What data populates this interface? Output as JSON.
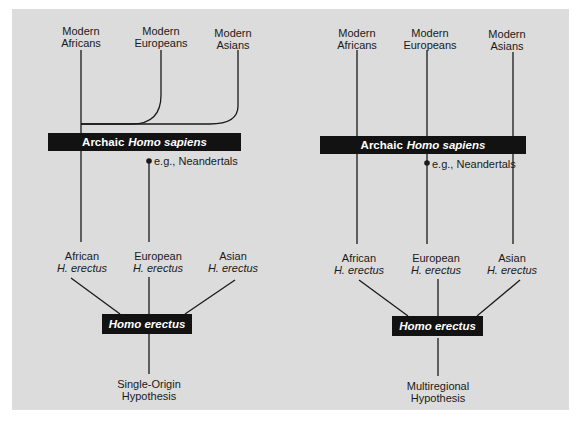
{
  "left": {
    "top_labels": [
      {
        "line1": "Modern",
        "line2": "Africans"
      },
      {
        "line1": "Modern",
        "line2": "Europeans"
      },
      {
        "line1": "Modern",
        "line2": "Asians"
      }
    ],
    "archaic_bar": {
      "plain": "Archaic",
      "italic": "Homo sapiens"
    },
    "note": "e.g., Neandertals",
    "mid_labels": [
      {
        "line1": "African",
        "line2": "H. erectus"
      },
      {
        "line1": "European",
        "line2": "H. erectus"
      },
      {
        "line1": "Asian",
        "line2": "H. erectus"
      }
    ],
    "erectus_bar": "Homo erectus",
    "caption": {
      "line1": "Single-Origin",
      "line2": "Hypothesis"
    }
  },
  "right": {
    "top_labels": [
      {
        "line1": "Modern",
        "line2": "Africans"
      },
      {
        "line1": "Modern",
        "line2": "Europeans"
      },
      {
        "line1": "Modern",
        "line2": "Asians"
      }
    ],
    "archaic_bar": {
      "plain": "Archaic",
      "italic": "Homo sapiens"
    },
    "note": "e.g., Neandertals",
    "mid_labels": [
      {
        "line1": "African",
        "line2": "H. erectus"
      },
      {
        "line1": "European",
        "line2": "H. erectus"
      },
      {
        "line1": "Asian",
        "line2": "H. erectus"
      }
    ],
    "erectus_bar": "Homo erectus",
    "caption": {
      "line1": "Multiregional",
      "line2": "Hypothesis"
    }
  },
  "colors": {
    "background": "#dcdcdc",
    "bar": "#121212",
    "line": "#1a1a1a"
  }
}
